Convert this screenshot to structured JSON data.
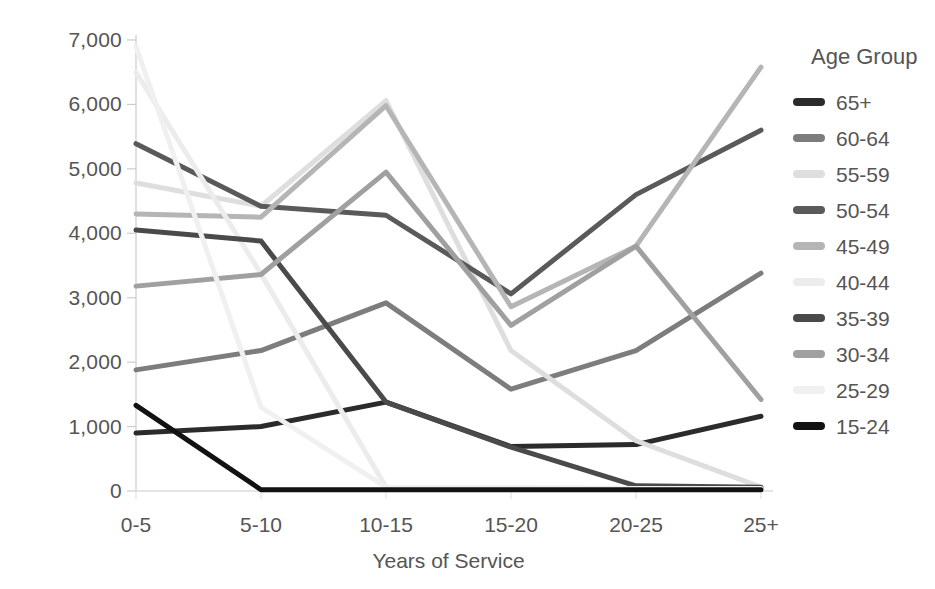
{
  "chart_data": {
    "type": "line",
    "title": "",
    "xlabel": "Years of Service",
    "ylabel": "",
    "categories": [
      "0-5",
      "5-10",
      "10-15",
      "15-20",
      "20-25",
      "25+"
    ],
    "ylim": [
      0,
      7000
    ],
    "yticks": [
      "0",
      "1,000",
      "2,000",
      "3,000",
      "4,000",
      "5,000",
      "6,000",
      "7,000"
    ],
    "ytick_values": [
      0,
      1000,
      2000,
      3000,
      4000,
      5000,
      6000,
      7000
    ],
    "grid": false,
    "legend_position": "right",
    "legend_title": "Age Group",
    "series": [
      {
        "name": "65+",
        "color": "#2b2b2b",
        "values": [
          900,
          1000,
          1380,
          690,
          720,
          1160
        ]
      },
      {
        "name": "60-64",
        "color": "#7d7d7d",
        "values": [
          1880,
          2180,
          2920,
          1580,
          2180,
          3380
        ]
      },
      {
        "name": "55-59",
        "color": "#dedede",
        "values": [
          4780,
          4420,
          6060,
          2180,
          780,
          60
        ]
      },
      {
        "name": "50-54",
        "color": "#5a5a5a",
        "values": [
          5390,
          4420,
          4280,
          3060,
          4600,
          5600
        ]
      },
      {
        "name": "45-49",
        "color": "#b5b5b5",
        "values": [
          4300,
          4250,
          5980,
          2860,
          3800,
          6580
        ]
      },
      {
        "name": "40-44",
        "color": "#ececec",
        "values": [
          6500,
          3370,
          60,
          50,
          40,
          40
        ]
      },
      {
        "name": "35-39",
        "color": "#4a4a4a",
        "values": [
          4050,
          3880,
          1380,
          680,
          80,
          60
        ]
      },
      {
        "name": "30-34",
        "color": "#a0a0a0",
        "values": [
          3180,
          3360,
          4950,
          2570,
          3800,
          1420
        ]
      },
      {
        "name": "25-29",
        "color": "#f0f0f0",
        "values": [
          6900,
          1300,
          60,
          50,
          40,
          40
        ]
      },
      {
        "name": "15-24",
        "color": "#121212",
        "values": [
          1330,
          20,
          20,
          20,
          20,
          20
        ]
      }
    ]
  },
  "axis": {
    "y_ticks": [
      "7,000",
      "6,000",
      "5,000",
      "4,000",
      "3,000",
      "2,000",
      "1,000",
      "0"
    ],
    "x_ticks": [
      "0-5",
      "5-10",
      "10-15",
      "15-20",
      "20-25",
      "25+"
    ],
    "x_title": "Years of Service"
  },
  "legend": {
    "title": "Age Group",
    "items": [
      {
        "label": "65+",
        "color": "#2b2b2b"
      },
      {
        "label": "60-64",
        "color": "#7d7d7d"
      },
      {
        "label": "55-59",
        "color": "#dedede"
      },
      {
        "label": "50-54",
        "color": "#5a5a5a"
      },
      {
        "label": "45-49",
        "color": "#b5b5b5"
      },
      {
        "label": "40-44",
        "color": "#ececec"
      },
      {
        "label": "35-39",
        "color": "#4a4a4a"
      },
      {
        "label": "30-34",
        "color": "#a0a0a0"
      },
      {
        "label": "25-29",
        "color": "#f0f0f0"
      },
      {
        "label": "15-24",
        "color": "#121212"
      }
    ]
  }
}
